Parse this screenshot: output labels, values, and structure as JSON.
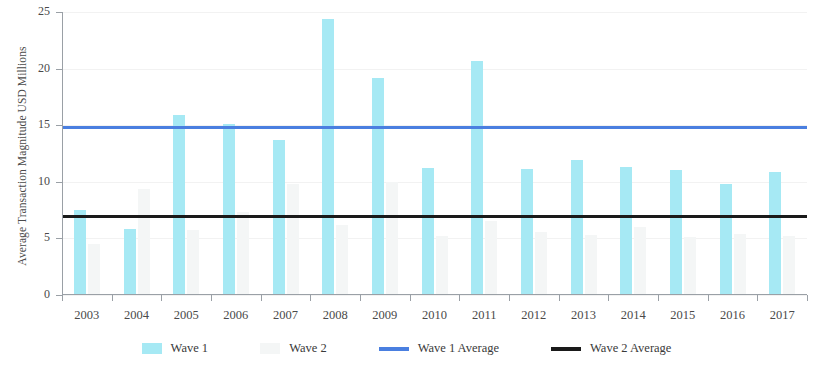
{
  "chart_data": {
    "type": "bar",
    "title": "",
    "xlabel": "",
    "ylabel": "Average Transaction Magnitude USD Millions",
    "categories": [
      "2003",
      "2004",
      "2005",
      "2006",
      "2007",
      "2008",
      "2009",
      "2010",
      "2011",
      "2012",
      "2013",
      "2014",
      "2015",
      "2016",
      "2017"
    ],
    "ylim": [
      0,
      25
    ],
    "yticks": [
      0,
      5,
      10,
      15,
      20,
      25
    ],
    "ytick_labels": [
      "0",
      "5",
      "10",
      "15",
      "20",
      "25"
    ],
    "grid": true,
    "legend_position": "bottom",
    "series": [
      {
        "name": "Wave 1",
        "type": "bar",
        "color": "#a6e9f4",
        "values": [
          7.5,
          5.8,
          15.9,
          15.1,
          13.7,
          24.4,
          19.2,
          11.2,
          20.7,
          11.1,
          11.9,
          11.3,
          11.0,
          9.8,
          10.9
        ]
      },
      {
        "name": "Wave 2",
        "type": "bar",
        "color": "#f4f6f6",
        "values": [
          4.5,
          9.4,
          5.7,
          7.3,
          9.8,
          6.2,
          10.0,
          5.2,
          6.5,
          5.6,
          5.3,
          6.0,
          5.1,
          5.4,
          5.2
        ]
      },
      {
        "name": "Wave 1 Average",
        "type": "line",
        "color": "#4a7fe0",
        "value": 14.8
      },
      {
        "name": "Wave 2 Average",
        "type": "line",
        "color": "#1a1a1a",
        "value": 7.0
      }
    ]
  },
  "legend": {
    "items": [
      {
        "label": "Wave 1",
        "swatch": "box",
        "color": "#a6e9f4"
      },
      {
        "label": "Wave 2",
        "swatch": "box",
        "color": "#f4f6f6"
      },
      {
        "label": "Wave 1 Average",
        "swatch": "line",
        "color": "#4a7fe0"
      },
      {
        "label": "Wave 2 Average",
        "swatch": "line",
        "color": "#1a1a1a"
      }
    ]
  }
}
